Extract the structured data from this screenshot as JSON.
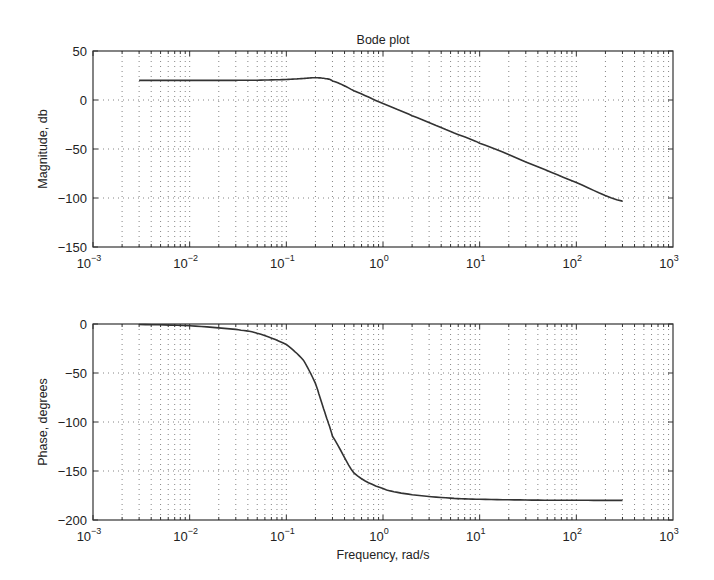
{
  "figure": {
    "title": "Bode plot",
    "stroke_color": "#333333",
    "background": "#ffffff"
  },
  "chart_data": [
    {
      "type": "line",
      "title": "Bode plot",
      "xlabel": "",
      "ylabel": "Magnitude, db",
      "xscale": "log",
      "xlim": [
        0.001,
        1000
      ],
      "ylim": [
        -150,
        50
      ],
      "grid": true,
      "x_tick_labels": [
        "10^-3",
        "10^-2",
        "10^-1",
        "10^0",
        "10^1",
        "10^2",
        "10^3"
      ],
      "x_ticks": [
        0.001,
        0.01,
        0.1,
        1,
        10,
        100,
        1000
      ],
      "y_tick_labels": [
        "50",
        "0",
        "-50",
        "-100",
        "-150"
      ],
      "y_ticks": [
        50,
        0,
        -50,
        -100,
        -150
      ],
      "series": [
        {
          "name": "Magnitude",
          "x": [
            0.003,
            0.01,
            0.03,
            0.05,
            0.1,
            0.15,
            0.2,
            0.25,
            0.3,
            0.5,
            1,
            2,
            5,
            10,
            30,
            100,
            300
          ],
          "values": [
            20.0,
            20.01,
            20.05,
            20.24,
            20.93,
            21.94,
            22.68,
            21.94,
            19.53,
            9.37,
            -3.7,
            -16.0,
            -32.0,
            -44.1,
            -63.2,
            -84.1,
            -103.2
          ]
        }
      ]
    },
    {
      "type": "line",
      "title": "",
      "xlabel": "Frequency, rad/s",
      "ylabel": "Phase, degrees",
      "xscale": "log",
      "xlim": [
        0.001,
        1000
      ],
      "ylim": [
        -200,
        0
      ],
      "grid": true,
      "x_tick_labels": [
        "10^-3",
        "10^-2",
        "10^-1",
        "10^0",
        "10^1",
        "10^2",
        "10^3"
      ],
      "x_ticks": [
        0.001,
        0.01,
        0.1,
        1,
        10,
        100,
        1000
      ],
      "y_tick_labels": [
        "0",
        "-50",
        "-100",
        "-150",
        "-200"
      ],
      "y_ticks": [
        0,
        -50,
        -100,
        -150,
        -200
      ],
      "series": [
        {
          "name": "Phase",
          "x": [
            0.003,
            0.01,
            0.03,
            0.05,
            0.1,
            0.15,
            0.2,
            0.25,
            0.3,
            0.5,
            1,
            2,
            5,
            10,
            30,
            100,
            300
          ],
          "values": [
            -0.55,
            -1.8,
            -5.5,
            -9.5,
            -20.9,
            -36.9,
            -60.6,
            -90.0,
            -114.6,
            -151.9,
            -168.0,
            -174.2,
            -177.7,
            -178.9,
            -179.6,
            -179.9,
            -180.0
          ]
        }
      ]
    }
  ],
  "model": {
    "dc_gain_db": 20,
    "natural_frequency": 0.25,
    "damping_ratio": 0.4
  }
}
